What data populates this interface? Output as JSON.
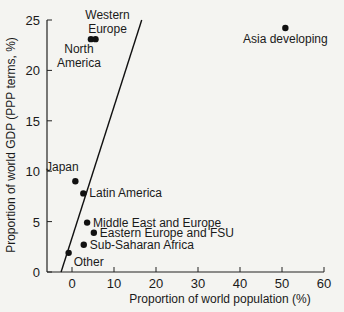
{
  "chart_data": {
    "type": "scatter",
    "title": "",
    "xlabel": "Proportion of world population (%)",
    "ylabel": "Proportion of world GDP (PPP terms, %)",
    "xlim": [
      -6,
      60
    ],
    "ylim": [
      0,
      25
    ],
    "x_ticks": [
      0,
      10,
      20,
      30,
      40,
      50,
      60
    ],
    "y_ticks": [
      0,
      5,
      10,
      15,
      20,
      25
    ],
    "grid": false,
    "legend": null,
    "points": [
      {
        "label": "Asia developing",
        "x": 50.8,
        "y": 24.2,
        "label_pos": "below"
      },
      {
        "label": "North America",
        "x": 4.5,
        "y": 23.1,
        "label_pos": "below-left"
      },
      {
        "label": "Western Europe",
        "x": 5.6,
        "y": 23.1,
        "label_pos": "above-right"
      },
      {
        "label": "Japan",
        "x": 0.8,
        "y": 9.0,
        "label_pos": "above-left"
      },
      {
        "label": "Latin America",
        "x": 2.7,
        "y": 7.8,
        "label_pos": "right"
      },
      {
        "label": "Middle East and Europe",
        "x": 3.6,
        "y": 4.9,
        "label_pos": "right"
      },
      {
        "label": "Eastern Europe and FSU",
        "x": 5.2,
        "y": 3.9,
        "label_pos": "right"
      },
      {
        "label": "Sub-Saharan Africa",
        "x": 2.8,
        "y": 2.7,
        "label_pos": "right"
      },
      {
        "label": "Other",
        "x": -0.8,
        "y": 1.9,
        "label_pos": "below-right"
      }
    ],
    "reference_line": {
      "description": "GDP share equals population share trend line",
      "x0": -2.6,
      "y0": 0,
      "x1": 16.6,
      "y1": 25
    }
  }
}
